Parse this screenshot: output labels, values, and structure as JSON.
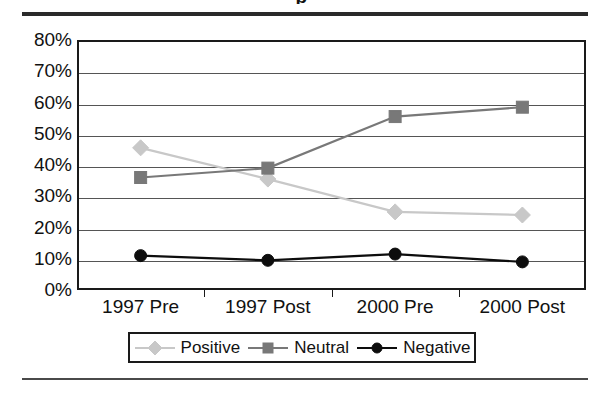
{
  "figure": {
    "title_fragment": "p",
    "background_color": "#ffffff"
  },
  "chart_data": {
    "type": "line",
    "title": "",
    "xlabel": "",
    "ylabel": "",
    "categories": [
      "1997 Pre",
      "1997 Post",
      "2000 Pre",
      "2000 Post"
    ],
    "ylim": [
      0,
      80
    ],
    "ytick_labels": [
      "0%",
      "10%",
      "20%",
      "30%",
      "40%",
      "50%",
      "60%",
      "70%",
      "80%"
    ],
    "ytick_values": [
      0,
      10,
      20,
      30,
      40,
      50,
      60,
      70,
      80
    ],
    "grid": true,
    "legend_position": "bottom",
    "value_suffix": "%",
    "series": [
      {
        "name": "Positive",
        "values": [
          45.5,
          35.5,
          25.0,
          24.0
        ],
        "color": "#c8c8c8",
        "marker": "diamond"
      },
      {
        "name": "Neutral",
        "values": [
          36.0,
          39.0,
          55.5,
          58.5
        ],
        "color": "#787878",
        "marker": "square"
      },
      {
        "name": "Negative",
        "values": [
          11.0,
          9.5,
          11.5,
          9.0
        ],
        "color": "#0d0d0d",
        "marker": "circle"
      }
    ]
  }
}
